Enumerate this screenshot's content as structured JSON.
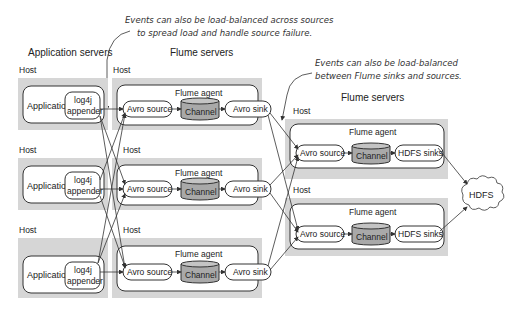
{
  "annotations": {
    "top_line1": "Events can also be load-balanced across sources",
    "top_line2": "to spread load and handle source failure.",
    "right_line1": "Events can also be load-balanced",
    "right_line2": "between Flume sinks and sources."
  },
  "sections": {
    "app_servers": "Application servers",
    "flume_servers_left": "Flume servers",
    "flume_servers_right": "Flume servers"
  },
  "labels": {
    "host": "Host",
    "application": "Application",
    "log4j": "log4j",
    "appender": "appender",
    "flume_agent": "Flume agent",
    "avro_source": "Avro source",
    "channel": "Channel",
    "avro_sink": "Avro sink",
    "hdfs_sinks": "HDFS sinks",
    "hdfs": "HDFS"
  },
  "colors": {
    "host_background": "#d6d6d6",
    "channel_fill": "#a9a9a9"
  }
}
